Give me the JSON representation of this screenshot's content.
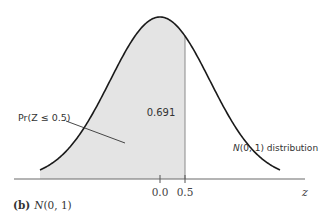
{
  "chart_data": {
    "type": "area",
    "title": "N(0, 1)",
    "panel_label": "(b)",
    "caption": "N(0, 1)",
    "distribution": "standard normal",
    "mean": 0.0,
    "sd": 1.0,
    "xlabel": "z",
    "ylabel": "",
    "x_ticks": [
      0.0,
      0.5
    ],
    "x_tick_labels": [
      "0.0",
      "0.5"
    ],
    "shaded_region": {
      "from": "-inf",
      "to": 0.5,
      "area": 0.691
    },
    "xlim": [
      -2.4,
      2.4
    ],
    "grid": false,
    "legend": "none",
    "annotations": [
      {
        "text": "Pr(Z ≤ 0.5)",
        "target": "shaded area"
      },
      {
        "text": "0.691",
        "position": "inside shaded area"
      },
      {
        "text": "N(0, 1) distribution",
        "target": "curve"
      }
    ]
  },
  "labels": {
    "panel": "(b)",
    "caption": "N(0, 1)",
    "area_value": "0.691",
    "prob_label": "Pr(Z ≤ 0.5)",
    "dist_label_italic": "N",
    "dist_label_rest": "(0, 1) distribution",
    "axis_var": "z",
    "tick0": "0.0",
    "tick1": "0.5"
  },
  "colors": {
    "shade": "#e4e4e4",
    "curve": "#1a1a1a",
    "axis": "#6a6a6a",
    "text": "#333333"
  }
}
